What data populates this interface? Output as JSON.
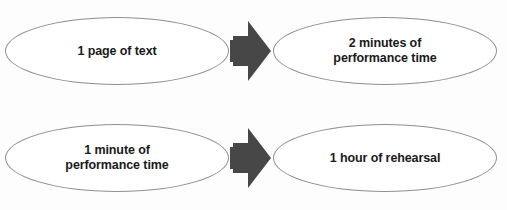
{
  "diagram": {
    "background_color": "#fdfdfd",
    "node_fill": "#ffffff",
    "node_stroke": "#8f8f8f",
    "arrow_color": "#474747",
    "text_color": "#1a1a1a",
    "rows": [
      {
        "id": "row-1",
        "source": {
          "label": "1 page of text"
        },
        "connector": {
          "icon": "right-block-arrow"
        },
        "target": {
          "label": "2 minutes of\nperformance time"
        }
      },
      {
        "id": "row-2",
        "source": {
          "label": "1 minute of\nperformance time"
        },
        "connector": {
          "icon": "right-block-arrow"
        },
        "target": {
          "label": "1 hour of rehearsal"
        }
      }
    ]
  }
}
